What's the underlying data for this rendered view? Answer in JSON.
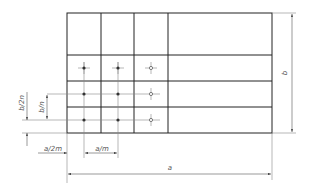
{
  "diagram": {
    "type": "technical drawing - grid of measurement points",
    "grid": {
      "left": 67,
      "top": 13,
      "right": 272,
      "bottom": 133,
      "columns_x": [
        101,
        134,
        168
      ],
      "rows_y": [
        55,
        81,
        107
      ]
    },
    "points": [
      {
        "x": 84,
        "y": 68,
        "style": "dot"
      },
      {
        "x": 118,
        "y": 68,
        "style": "dot"
      },
      {
        "x": 151,
        "y": 68,
        "style": "circle"
      },
      {
        "x": 84,
        "y": 94,
        "style": "dot"
      },
      {
        "x": 118,
        "y": 94,
        "style": "dot"
      },
      {
        "x": 151,
        "y": 94,
        "style": "circle"
      },
      {
        "x": 84,
        "y": 120,
        "style": "dot"
      },
      {
        "x": 118,
        "y": 120,
        "style": "dot"
      },
      {
        "x": 151,
        "y": 120,
        "style": "circle"
      }
    ],
    "labels": {
      "b": "b",
      "a": "a",
      "b_over_n": "b/n",
      "b_over_2n": "b/2n",
      "a_over_m": "a/m",
      "a_over_2m": "a/2m"
    }
  }
}
